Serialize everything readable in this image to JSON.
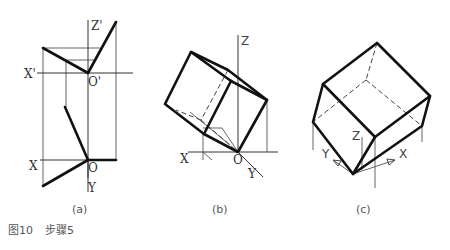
{
  "panels": {
    "a": {
      "caption": "(a)",
      "labels": {
        "z_prime": "Z'",
        "x_prime": "X'",
        "o_prime": "O'",
        "x": "X",
        "o": "O",
        "y": "Y"
      }
    },
    "b": {
      "caption": "(b)",
      "labels": {
        "z": "Z",
        "x": "X",
        "o": "O",
        "y": "Y"
      }
    },
    "c": {
      "caption": "(c)",
      "labels": {
        "z": "Z",
        "x": "X",
        "y": "Y"
      }
    }
  },
  "figure_caption": {
    "number": "图10",
    "title": "步骤5"
  }
}
